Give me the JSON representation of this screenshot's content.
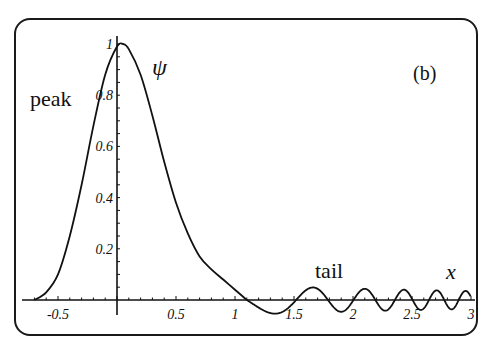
{
  "chart_data": {
    "type": "line",
    "title": "",
    "panel_label": "(b)",
    "xlabel": "x",
    "ylabel": "ψ",
    "xlim": [
      -0.7,
      3.0
    ],
    "ylim": [
      -0.05,
      1.05
    ],
    "grid": false,
    "legend": null,
    "x_ticks": [
      -0.5,
      0.5,
      1,
      1.5,
      2,
      2.5,
      3
    ],
    "x_tick_labels": [
      "-0.5",
      "0.5",
      "1",
      "1.5",
      "2",
      "2.5",
      "3"
    ],
    "y_ticks": [
      0.2,
      0.4,
      0.6,
      0.8,
      1
    ],
    "y_tick_labels": [
      "0.2",
      "0.4",
      "0.6",
      "0.8",
      "1"
    ],
    "annotations": [
      {
        "text": "peak",
        "x": -0.6,
        "y": 0.9
      },
      {
        "text": "tail",
        "x": 1.7,
        "y": 0.1
      },
      {
        "text": "ψ",
        "x": 0.32,
        "y": 0.92
      },
      {
        "text": "x",
        "x": 2.85,
        "y": 0.1
      },
      {
        "text": "(b)",
        "x": 2.6,
        "y": 0.9
      }
    ],
    "series": [
      {
        "name": "ψ(x)",
        "x": [
          -0.7,
          -0.6,
          -0.5,
          -0.4,
          -0.3,
          -0.2,
          -0.1,
          0.0,
          0.05,
          0.1,
          0.2,
          0.3,
          0.4,
          0.5,
          0.6,
          0.7,
          0.8,
          0.9,
          1.0,
          1.1,
          1.2,
          1.3,
          1.4,
          1.5,
          1.6,
          1.7,
          1.8,
          1.9,
          2.0,
          2.2,
          2.4,
          2.6,
          2.8,
          3.0
        ],
        "y": [
          0.0,
          0.03,
          0.1,
          0.25,
          0.45,
          0.68,
          0.88,
          0.99,
          1.0,
          0.98,
          0.88,
          0.72,
          0.54,
          0.38,
          0.26,
          0.17,
          0.12,
          0.08,
          0.04,
          0.0,
          -0.04,
          -0.02,
          0.03,
          0.03,
          -0.03,
          0.02,
          -0.02,
          0.02,
          -0.02,
          0.015,
          -0.015,
          0.012,
          -0.012,
          0.01
        ]
      }
    ]
  },
  "labels": {
    "peak": "peak",
    "tail": "tail",
    "psi": "ψ",
    "x": "x",
    "panel": "(b)"
  }
}
